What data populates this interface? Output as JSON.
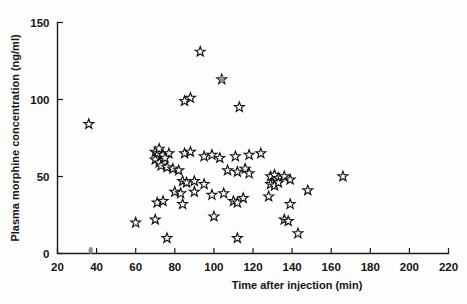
{
  "chart_data": {
    "type": "scatter",
    "title": "",
    "xlabel": "Time after injection (min)",
    "ylabel": "Plasma morphine concentration (ng/ml)",
    "xlim": [
      20,
      220
    ],
    "ylim": [
      0,
      150
    ],
    "xticks": [
      20,
      40,
      60,
      80,
      100,
      120,
      140,
      160,
      180,
      200,
      220
    ],
    "yticks": [
      0,
      50,
      100,
      150
    ],
    "xtick_labels": [
      "20",
      "40",
      "60",
      "80",
      "100",
      "120",
      "140",
      "160",
      "180",
      "200",
      "220"
    ],
    "ytick_labels": [
      "0",
      "50",
      "100",
      "150"
    ],
    "grid": false,
    "legend": false,
    "marker": "open-five-pointed-star",
    "series": [
      {
        "name": "Plasma morphine concentration",
        "points": [
          [
            36,
            84
          ],
          [
            93,
            131
          ],
          [
            104,
            113
          ],
          [
            88,
            101
          ],
          [
            85,
            99
          ],
          [
            113,
            95
          ],
          [
            70,
            66
          ],
          [
            71,
            65
          ],
          [
            72,
            68
          ],
          [
            74,
            64
          ],
          [
            77,
            65
          ],
          [
            70,
            61
          ],
          [
            72,
            59
          ],
          [
            75,
            62
          ],
          [
            73,
            57
          ],
          [
            85,
            65
          ],
          [
            88,
            66
          ],
          [
            95,
            63
          ],
          [
            99,
            64
          ],
          [
            103,
            62
          ],
          [
            111,
            63
          ],
          [
            118,
            64
          ],
          [
            124,
            65
          ],
          [
            76,
            56
          ],
          [
            79,
            55
          ],
          [
            82,
            54
          ],
          [
            107,
            54
          ],
          [
            112,
            53
          ],
          [
            116,
            55
          ],
          [
            118,
            52
          ],
          [
            129,
            50
          ],
          [
            131,
            51
          ],
          [
            133,
            49
          ],
          [
            136,
            50
          ],
          [
            139,
            48
          ],
          [
            166,
            50
          ],
          [
            84,
            47
          ],
          [
            86,
            46
          ],
          [
            90,
            47
          ],
          [
            95,
            45
          ],
          [
            129,
            45
          ],
          [
            131,
            44
          ],
          [
            133,
            46
          ],
          [
            80,
            40
          ],
          [
            83,
            39
          ],
          [
            90,
            40
          ],
          [
            99,
            38
          ],
          [
            105,
            39
          ],
          [
            115,
            36
          ],
          [
            128,
            37
          ],
          [
            148,
            41
          ],
          [
            71,
            33
          ],
          [
            74,
            34
          ],
          [
            84,
            32
          ],
          [
            110,
            34
          ],
          [
            112,
            33
          ],
          [
            139,
            32
          ],
          [
            60,
            20
          ],
          [
            70,
            22
          ],
          [
            100,
            24
          ],
          [
            136,
            22
          ],
          [
            138,
            21
          ],
          [
            76,
            10
          ],
          [
            112,
            10
          ],
          [
            143,
            13
          ]
        ]
      }
    ],
    "stray_specks": [
      [
        104,
        113
      ],
      [
        37,
        2
      ]
    ]
  },
  "axis": {
    "x_axis_name": "time-axis",
    "y_axis_name": "concentration-axis"
  }
}
